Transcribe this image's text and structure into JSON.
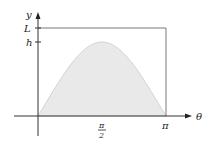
{
  "diagram": {
    "y_axis_label": "y",
    "x_axis_label": "θ",
    "y_ticks": [
      {
        "label": "L"
      },
      {
        "label": "h"
      }
    ],
    "x_ticks": [
      {
        "numerator": "π",
        "denominator": "2"
      },
      {
        "label": "π"
      }
    ],
    "curve": "sine arch from 0 to π with peak h",
    "fill_color": "#e9e9e9",
    "curve_color": "#d4d4d4",
    "axis_color": "#333333",
    "box_color": "#7a7a7a"
  }
}
